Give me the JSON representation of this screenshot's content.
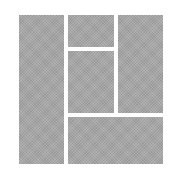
{
  "layout_icon": {
    "name": "mosaic-grid-layout",
    "fill_color": "#a6a6a6",
    "background": "#ffffff",
    "tiles": [
      {
        "id": "left-tall",
        "x": 19,
        "y": 15,
        "w": 45,
        "h": 149
      },
      {
        "id": "top-middle",
        "x": 68,
        "y": 15,
        "w": 46,
        "h": 32
      },
      {
        "id": "middle",
        "x": 68,
        "y": 51,
        "w": 46,
        "h": 62
      },
      {
        "id": "right-tall",
        "x": 118,
        "y": 15,
        "w": 45,
        "h": 98
      },
      {
        "id": "bottom-wide",
        "x": 68,
        "y": 117,
        "w": 95,
        "h": 47
      }
    ]
  }
}
